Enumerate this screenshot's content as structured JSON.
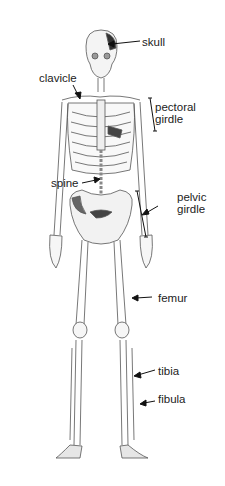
{
  "figure": {
    "labels": {
      "skull": "skull",
      "clavicle": "clavicle",
      "pectoral_1": "pectoral",
      "pectoral_2": "girdle",
      "spine": "spine",
      "pelvic_1": "pelvic",
      "pelvic_2": "girdle",
      "femur": "femur",
      "tibia": "tibia",
      "fibula": "fibula"
    }
  }
}
